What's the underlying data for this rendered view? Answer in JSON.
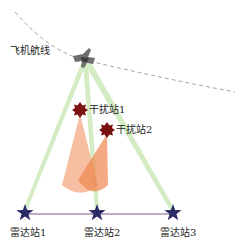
{
  "diagram": {
    "flight_path_label": "飞机航线",
    "aircraft": {
      "icon": "fighter-jet-icon",
      "x": 85,
      "y": 60
    },
    "jammers": [
      {
        "label": "干扰站1",
        "x": 80,
        "y": 110,
        "icon": "jammer-star-icon"
      },
      {
        "label": "干扰站2",
        "x": 107,
        "y": 130,
        "icon": "jammer-star-icon"
      }
    ],
    "radars": [
      {
        "label": "雷达站1",
        "x": 25,
        "y": 213,
        "icon": "radar-star-icon"
      },
      {
        "label": "雷达站2",
        "x": 97,
        "y": 213,
        "icon": "radar-star-icon"
      },
      {
        "label": "雷达站3",
        "x": 173,
        "y": 213,
        "icon": "radar-star-icon"
      }
    ],
    "colors": {
      "beam": "#c6e6b0",
      "jam_cone": "#f39a6a",
      "jammer": "#7a1010",
      "radar": "#2a2a66",
      "baseline": "#7a5a80",
      "flight_path": "#777777",
      "aircraft": "#707070"
    }
  }
}
